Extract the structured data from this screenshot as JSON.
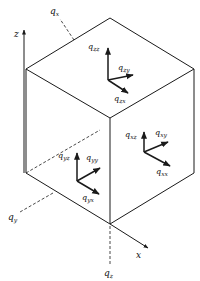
{
  "diagram": {
    "type": "stress-tensor-cube",
    "axes": {
      "x": "x",
      "z": "z"
    },
    "normals": {
      "qx": "q",
      "qx_sub": "x",
      "qy": "q",
      "qy_sub": "y",
      "qz": "q",
      "qz_sub": "z"
    },
    "top_face": {
      "zz": "zz",
      "zy": "zy",
      "zx": "zx"
    },
    "right_face": {
      "xz": "xz",
      "xy": "xy",
      "xx": "xx"
    },
    "left_face": {
      "yz": "yz",
      "yy": "yy",
      "yx": "yx"
    },
    "symbol": "q",
    "colors": {
      "stroke": "#1a1a1a",
      "background": "#ffffff"
    }
  }
}
